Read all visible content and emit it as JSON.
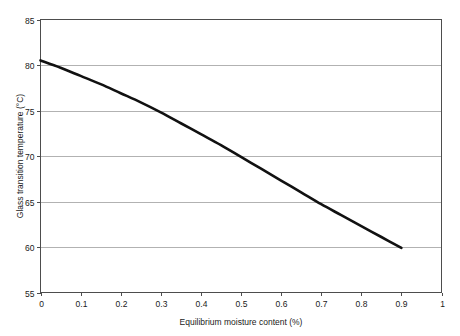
{
  "chart_data": {
    "type": "line",
    "title": "",
    "xlabel": "Equilibrium moisture content (%)",
    "ylabel": "Glass transition temperature (°C)",
    "xlim": [
      0,
      1
    ],
    "ylim": [
      55,
      85
    ],
    "xticks": [
      "0",
      "0.1",
      "0.2",
      "0.3",
      "0.4",
      "0.5",
      "0.6",
      "0.7",
      "0.8",
      "0.9",
      "1"
    ],
    "yticks": [
      "55",
      "60",
      "65",
      "70",
      "75",
      "80",
      "85"
    ],
    "grid": "horizontal",
    "legend": "none",
    "series": [
      {
        "name": "Glass transition temperature",
        "color": "#111111",
        "x": [
          0.0,
          0.05,
          0.1,
          0.15,
          0.2,
          0.25,
          0.3,
          0.35,
          0.4,
          0.45,
          0.5,
          0.55,
          0.6,
          0.65,
          0.7,
          0.75,
          0.8,
          0.85,
          0.9
        ],
        "values": [
          80.5,
          79.7,
          78.8,
          77.9,
          76.9,
          75.9,
          74.8,
          73.6,
          72.4,
          71.2,
          69.9,
          68.6,
          67.3,
          66.0,
          64.7,
          63.5,
          62.3,
          61.1,
          59.9
        ]
      }
    ]
  },
  "axes": {
    "x_title": "Equilibrium moisture content (%)",
    "y_title": "Glass transition temperature (°C)"
  }
}
